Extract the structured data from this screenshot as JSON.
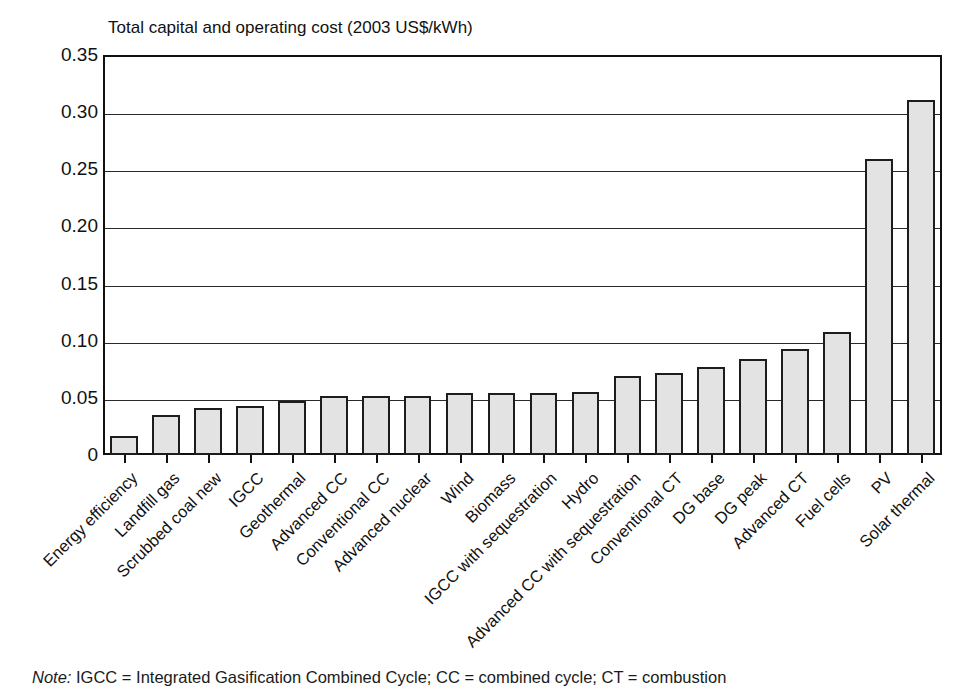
{
  "chart_data": {
    "type": "bar",
    "title": "Total capital and operating cost (2003 US$/kWh)",
    "xlabel": "",
    "ylabel": "",
    "ylim": [
      0,
      0.35
    ],
    "grid": true,
    "legend": "none",
    "ytick_labels": [
      "0.35",
      "0.30",
      "0.25",
      "0.20",
      "0.15",
      "0.10",
      "0.05",
      "0"
    ],
    "ytick_values": [
      0.35,
      0.3,
      0.25,
      0.2,
      0.15,
      0.1,
      0.05,
      0
    ],
    "categories": [
      "Energy efficiency",
      "Landfill gas",
      "Scrubbed coal new",
      "IGCC",
      "Geothermal",
      "Advanced CC",
      "Conventional CC",
      "Advanced nuclear",
      "Wind",
      "Biomass",
      "IGCC with sequestration",
      "Hydro",
      "Advanced CC with sequestration",
      "Conventional CT",
      "DG base",
      "DG peak",
      "Advanced CT",
      "Fuel cells",
      "PV",
      "Solar thermal"
    ],
    "values": [
      0.017,
      0.035,
      0.041,
      0.043,
      0.047,
      0.052,
      0.052,
      0.052,
      0.054,
      0.054,
      0.054,
      0.055,
      0.069,
      0.072,
      0.077,
      0.084,
      0.093,
      0.108,
      0.259,
      0.311
    ],
    "bar_fill_color": "#e3e3e3",
    "bar_edge_color": "#1d1d1d",
    "axis_color": "#111111",
    "background_color": "#ffffff"
  },
  "note": {
    "label": "Note:",
    "text": " IGCC = Integrated Gasification Combined Cycle; CC = combined cycle; CT = combustion"
  }
}
